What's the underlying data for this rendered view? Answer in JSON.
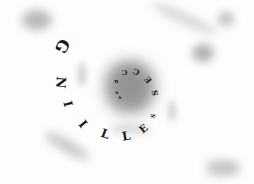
{
  "image": {
    "text": "SUCCESS SELLING",
    "inner_word": "SUCCESS",
    "outer_word": "SELLING",
    "colors": {
      "background": "#fdfdfd",
      "text": "#1a1a1a",
      "blur": "#9e9e9e"
    },
    "letters": [
      {
        "ch": "s",
        "x": 121,
        "y": 97,
        "size": 5,
        "rot": 0
      },
      {
        "ch": "s",
        "x": 118,
        "y": 92,
        "size": 5,
        "rot": 0
      },
      {
        "ch": "u",
        "x": 117,
        "y": 82,
        "size": 6,
        "rot": 180
      },
      {
        "ch": "C",
        "x": 125,
        "y": 72,
        "size": 7,
        "rot": 180
      },
      {
        "ch": "C",
        "x": 137,
        "y": 72,
        "size": 8,
        "rot": 200
      },
      {
        "ch": "E",
        "x": 149,
        "y": 80,
        "size": 8,
        "rot": 230
      },
      {
        "ch": "S",
        "x": 156,
        "y": 93,
        "size": 8,
        "rot": 260
      },
      {
        "ch": "S",
        "x": 154,
        "y": 116,
        "size": 6,
        "rot": 290
      },
      {
        "ch": "E",
        "x": 145,
        "y": 129,
        "size": 10,
        "rot": 320
      },
      {
        "ch": "L",
        "x": 128,
        "y": 136,
        "size": 12,
        "rot": 350
      },
      {
        "ch": "L",
        "x": 107,
        "y": 134,
        "size": 12,
        "rot": 20
      },
      {
        "ch": "I",
        "x": 86,
        "y": 124,
        "size": 12,
        "rot": 50
      },
      {
        "ch": "I",
        "x": 71,
        "y": 104,
        "size": 12,
        "rot": 75
      },
      {
        "ch": "N",
        "x": 61,
        "y": 82,
        "size": 13,
        "rot": 95
      },
      {
        "ch": "G",
        "x": 63,
        "y": 46,
        "size": 16,
        "rot": 120
      }
    ]
  }
}
